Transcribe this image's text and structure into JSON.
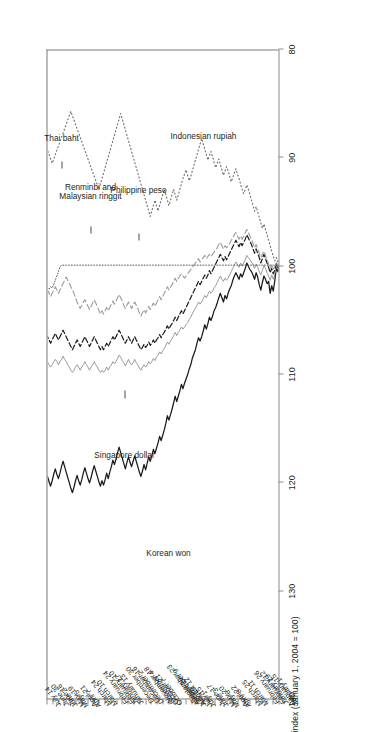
{
  "chart_data": {
    "type": "line",
    "title": "",
    "subtitle": "",
    "ylabel": "index (January 1, 2004 = 100)",
    "xlabel": "",
    "ylim": [
      80,
      140
    ],
    "yticks": [
      140,
      130,
      120,
      110,
      100,
      90,
      80
    ],
    "grid": false,
    "legend_position": "in-plot annotations",
    "orientation": "rotated 90 degrees (page printed sideways)",
    "year_groups": [
      {
        "label": "2004",
        "start_tick": "January 1",
        "end_tick": "December 30"
      },
      {
        "label": "2005",
        "start_tick": "January 13",
        "end_tick": "July 14"
      }
    ],
    "x_tick_labels": [
      "January 1",
      "January 15",
      "January 29",
      "February 12",
      "February 26",
      "March 11",
      "March 25",
      "April 8",
      "April 22",
      "May 6",
      "May 20",
      "June 3",
      "June 17",
      "July 1",
      "July 15",
      "July 29",
      "August 12",
      "August 26",
      "September 9",
      "September 23",
      "October 7",
      "October 21",
      "November 4",
      "November 18",
      "December 2",
      "December 16",
      "December 30",
      "January 13",
      "January 27",
      "February 10",
      "February 24",
      "March 10",
      "March 24",
      "April 7",
      "April 21",
      "May 5",
      "May 19",
      "June 2",
      "June 16",
      "June 30",
      "July 14"
    ],
    "series": [
      {
        "name": "Korean won",
        "style": "solid",
        "color": "#1a1a1a",
        "width": 1.25,
        "values": [
          100.0,
          100.6,
          100.2,
          101.4,
          102.4,
          101.9,
          102.6,
          101.5,
          101.7,
          101.3,
          101.0,
          101.6,
          102.3,
          101.8,
          101.1,
          100.7,
          101.3,
          100.9,
          100.6,
          100.4,
          100.1,
          99.8,
          100.3,
          100.7,
          101.1,
          100.8,
          101.3,
          101.0,
          100.7,
          101.0,
          101.4,
          101.9,
          102.2,
          102.6,
          103.1,
          102.8,
          103.4,
          103.0,
          102.6,
          103.0,
          103.5,
          103.9,
          104.2,
          104.7,
          105.1,
          104.8,
          105.4,
          105.9,
          105.5,
          106.1,
          106.6,
          107.0,
          106.7,
          107.2,
          107.8,
          108.2,
          108.6,
          109.2,
          109.6,
          110.1,
          110.5,
          110.9,
          111.4,
          111.0,
          111.6,
          112.1,
          112.6,
          112.1,
          112.7,
          113.3,
          113.8,
          114.3,
          113.9,
          114.6,
          115.2,
          115.7,
          116.2,
          115.8,
          116.4,
          116.9,
          117.4,
          117.0,
          117.6,
          118.1,
          117.7,
          118.3,
          118.9,
          118.4,
          119.0,
          119.5,
          119.1,
          118.6,
          118.1,
          117.6,
          118.1,
          118.6,
          118.2,
          117.7,
          118.2,
          118.8,
          118.3,
          117.8,
          117.3,
          116.8,
          117.3,
          117.9,
          118.4,
          118.0,
          118.6,
          119.1,
          119.7,
          119.2,
          119.8,
          120.3,
          119.9,
          120.4,
          120.0,
          119.5,
          119.0,
          118.5,
          119.0,
          119.6,
          120.1,
          119.7,
          119.2,
          118.7,
          119.2,
          119.8,
          120.3,
          119.9,
          119.4,
          119.9,
          120.5,
          121.0,
          120.6,
          120.1,
          119.6,
          119.1,
          118.6,
          118.1,
          118.6,
          119.2,
          119.7,
          119.3,
          118.8,
          119.3,
          119.9,
          120.4,
          120.0,
          119.5
        ]
      },
      {
        "name": "Singapore dollar",
        "style": "solid-thin",
        "color": "#8f8f8f",
        "width": 0.9,
        "values": [
          100.0,
          100.4,
          100.1,
          100.8,
          101.3,
          100.9,
          101.4,
          101.0,
          100.7,
          100.3,
          100.0,
          100.5,
          100.9,
          100.6,
          100.2,
          99.9,
          100.3,
          100.0,
          99.7,
          99.5,
          99.3,
          99.1,
          99.5,
          99.8,
          100.1,
          99.8,
          100.2,
          99.9,
          99.7,
          100.0,
          100.3,
          100.6,
          100.9,
          101.2,
          101.4,
          101.2,
          101.5,
          101.3,
          101.0,
          101.3,
          101.6,
          101.9,
          102.1,
          102.4,
          102.6,
          102.4,
          102.7,
          103.0,
          102.8,
          103.1,
          103.4,
          103.6,
          103.4,
          103.7,
          104.0,
          104.2,
          104.5,
          104.8,
          105.0,
          105.3,
          105.5,
          105.7,
          105.9,
          105.7,
          106.0,
          106.2,
          106.5,
          106.2,
          106.5,
          106.8,
          107.0,
          107.3,
          107.1,
          107.4,
          107.7,
          107.9,
          108.2,
          108.0,
          108.3,
          108.5,
          108.8,
          108.6,
          108.9,
          109.1,
          108.9,
          109.2,
          109.4,
          109.2,
          109.4,
          109.7,
          109.5,
          109.2,
          109.0,
          108.7,
          109.0,
          109.2,
          109.0,
          108.7,
          109.0,
          109.3,
          109.0,
          108.8,
          108.5,
          108.3,
          108.6,
          108.9,
          109.1,
          108.9,
          109.2,
          109.4,
          109.7,
          109.4,
          109.7,
          109.9,
          109.7,
          109.9,
          109.7,
          109.4,
          109.2,
          108.9,
          109.2,
          109.4,
          109.7,
          109.4,
          109.2,
          108.9,
          109.2,
          109.4,
          109.7,
          109.4,
          109.2,
          109.4,
          109.7,
          109.9,
          109.7,
          109.4,
          109.2,
          108.9,
          108.7,
          108.4,
          108.7,
          108.9,
          109.2,
          108.9,
          108.7,
          108.9,
          109.2,
          109.4,
          109.2,
          108.9
        ]
      },
      {
        "name": "Renminbi and Malaysian ringgit",
        "style": "dotted-fine",
        "color": "#555555",
        "width": 1.0,
        "values": [
          100.0,
          100.0,
          100.0,
          100.0,
          100.0,
          100.0,
          100.0,
          100.0,
          100.0,
          100.0,
          100.0,
          100.0,
          100.0,
          100.0,
          100.0,
          100.0,
          100.0,
          100.0,
          100.0,
          100.0,
          100.0,
          100.0,
          100.0,
          100.0,
          100.0,
          100.0,
          100.0,
          100.0,
          100.0,
          100.0,
          100.0,
          100.0,
          100.0,
          100.0,
          100.0,
          100.0,
          100.0,
          100.0,
          100.0,
          100.0,
          100.0,
          100.0,
          100.0,
          100.0,
          100.0,
          100.0,
          100.0,
          100.0,
          100.0,
          100.0,
          100.0,
          100.0,
          100.0,
          100.0,
          100.0,
          100.0,
          100.0,
          100.0,
          100.0,
          100.0,
          100.0,
          100.0,
          100.0,
          100.0,
          100.0,
          100.0,
          100.0,
          100.0,
          100.0,
          100.0,
          100.0,
          100.0,
          100.0,
          100.0,
          100.0,
          100.0,
          100.0,
          100.0,
          100.0,
          100.0,
          100.0,
          100.0,
          100.0,
          100.0,
          100.0,
          100.0,
          100.0,
          100.0,
          100.0,
          100.0,
          100.0,
          100.0,
          100.0,
          100.0,
          100.0,
          100.0,
          100.0,
          100.0,
          100.0,
          100.0,
          100.0,
          100.0,
          100.0,
          100.0,
          100.0,
          100.0,
          100.0,
          100.0,
          100.0,
          100.0,
          100.0,
          100.0,
          100.0,
          100.0,
          100.0,
          100.0,
          100.0,
          100.0,
          100.0,
          100.0,
          100.0,
          100.0,
          100.0,
          100.0,
          100.0,
          100.0,
          100.0,
          100.0,
          100.0,
          100.0,
          100.0,
          100.0,
          100.0,
          100.0,
          100.0,
          100.0,
          100.0,
          100.0,
          100.0,
          100.0,
          100.0,
          100.2,
          100.6,
          101.0,
          101.4,
          101.8,
          102.1,
          102.0,
          102.2,
          102.1
        ]
      },
      {
        "name": "Philippine peso",
        "style": "dashed-bold",
        "color": "#1a1a1a",
        "width": 1.2,
        "values": [
          100.0,
          100.2,
          99.8,
          100.4,
          100.8,
          100.3,
          100.7,
          100.2,
          99.8,
          99.4,
          99.0,
          99.4,
          99.8,
          99.3,
          98.9,
          98.5,
          98.9,
          98.5,
          98.1,
          97.8,
          97.5,
          97.2,
          97.6,
          97.9,
          98.2,
          97.9,
          98.3,
          98.0,
          97.7,
          98.0,
          98.3,
          98.6,
          98.9,
          99.2,
          99.5,
          99.2,
          99.6,
          99.3,
          99.0,
          99.3,
          99.6,
          99.9,
          100.2,
          100.5,
          100.8,
          100.5,
          100.9,
          101.2,
          100.9,
          101.2,
          101.5,
          101.8,
          101.5,
          101.8,
          102.1,
          102.4,
          102.7,
          103.0,
          103.3,
          103.6,
          103.9,
          104.2,
          104.5,
          104.2,
          104.5,
          104.8,
          105.1,
          104.8,
          105.1,
          105.4,
          105.6,
          105.9,
          105.6,
          105.9,
          106.2,
          106.4,
          106.7,
          106.4,
          106.7,
          106.9,
          107.2,
          106.9,
          107.2,
          107.4,
          107.1,
          107.4,
          107.6,
          107.3,
          107.6,
          107.8,
          107.5,
          107.2,
          106.9,
          106.6,
          106.9,
          107.2,
          106.9,
          106.6,
          106.9,
          107.2,
          106.9,
          106.6,
          106.3,
          106.0,
          106.3,
          106.6,
          106.9,
          106.6,
          106.9,
          107.2,
          107.5,
          107.2,
          107.5,
          107.8,
          107.5,
          107.8,
          107.5,
          107.2,
          106.9,
          106.6,
          106.9,
          107.2,
          107.5,
          107.2,
          106.9,
          106.6,
          106.9,
          107.2,
          107.5,
          107.2,
          106.9,
          107.2,
          107.5,
          107.8,
          107.5,
          107.2,
          106.9,
          106.6,
          106.3,
          106.0,
          106.3,
          106.6,
          106.9,
          106.6,
          106.3,
          106.6,
          106.9,
          107.2,
          106.9,
          106.6
        ]
      },
      {
        "name": "Thai baht",
        "style": "dashed-light",
        "color": "#9a9a9a",
        "width": 1.1,
        "values": [
          100.0,
          100.1,
          99.7,
          100.1,
          100.4,
          100.0,
          100.3,
          99.9,
          99.5,
          99.1,
          98.7,
          99.0,
          99.3,
          98.9,
          98.5,
          98.1,
          98.4,
          98.0,
          97.6,
          97.3,
          97.0,
          96.7,
          97.0,
          97.3,
          97.6,
          97.3,
          97.6,
          97.3,
          97.0,
          97.2,
          97.5,
          97.7,
          98.0,
          98.2,
          98.4,
          98.2,
          98.5,
          98.2,
          97.9,
          98.1,
          98.4,
          98.6,
          98.8,
          99.0,
          99.2,
          99.0,
          99.2,
          99.4,
          99.1,
          99.3,
          99.5,
          99.7,
          99.4,
          99.6,
          99.8,
          100.0,
          100.2,
          100.4,
          100.6,
          100.8,
          101.0,
          101.2,
          101.0,
          100.8,
          101.0,
          101.2,
          101.5,
          101.2,
          101.5,
          101.8,
          102.0,
          102.3,
          102.0,
          102.3,
          102.6,
          102.9,
          103.2,
          102.9,
          103.2,
          103.5,
          103.8,
          103.5,
          103.8,
          104.1,
          103.8,
          104.1,
          104.4,
          104.1,
          104.4,
          104.7,
          104.4,
          104.0,
          103.7,
          103.4,
          103.7,
          104.0,
          103.7,
          103.4,
          103.7,
          104.0,
          103.7,
          103.3,
          103.0,
          102.7,
          103.0,
          103.3,
          103.6,
          103.3,
          103.6,
          103.9,
          104.2,
          103.9,
          104.2,
          104.5,
          104.2,
          104.5,
          104.2,
          103.8,
          103.5,
          103.2,
          103.5,
          103.8,
          104.1,
          103.8,
          103.5,
          103.2,
          103.4,
          103.7,
          104.0,
          103.7,
          103.4,
          103.0,
          102.6,
          102.3,
          102.0,
          101.7,
          101.4,
          101.1,
          101.4,
          101.7,
          102.0,
          102.3,
          102.6,
          102.3,
          102.0,
          102.3,
          102.6,
          102.9,
          102.6,
          102.3
        ]
      },
      {
        "name": "Indonesian rupiah",
        "style": "dotted",
        "color": "#6b6b6b",
        "width": 1.1,
        "values": [
          100.0,
          99.7,
          99.3,
          99.6,
          99.2,
          98.7,
          98.2,
          97.7,
          97.2,
          96.7,
          96.2,
          96.6,
          96.1,
          95.6,
          95.1,
          94.6,
          95.0,
          94.5,
          94.0,
          93.5,
          93.0,
          92.6,
          93.0,
          93.4,
          93.0,
          92.5,
          92.0,
          91.6,
          91.1,
          91.5,
          91.9,
          92.3,
          91.8,
          91.3,
          90.9,
          91.3,
          91.7,
          91.2,
          90.7,
          90.2,
          90.6,
          91.0,
          90.5,
          90.0,
          89.5,
          89.9,
          90.3,
          89.8,
          89.3,
          88.8,
          88.3,
          88.8,
          89.3,
          89.8,
          90.3,
          90.8,
          91.3,
          91.8,
          92.2,
          91.7,
          91.2,
          91.6,
          92.0,
          92.5,
          93.0,
          93.5,
          94.0,
          93.5,
          93.0,
          93.5,
          94.0,
          94.5,
          94.0,
          93.5,
          93.0,
          93.5,
          94.0,
          94.5,
          95.0,
          94.5,
          94.0,
          94.5,
          95.0,
          95.5,
          95.0,
          94.5,
          94.0,
          93.5,
          93.0,
          92.5,
          92.0,
          91.5,
          91.0,
          90.5,
          90.0,
          89.5,
          89.0,
          88.5,
          88.0,
          87.5,
          87.0,
          86.5,
          86.0,
          86.5,
          87.0,
          87.5,
          88.0,
          88.5,
          89.0,
          89.5,
          90.0,
          90.5,
          91.0,
          91.5,
          92.0,
          92.5,
          93.0,
          92.6,
          92.2,
          91.8,
          91.4,
          91.0,
          90.6,
          90.2,
          89.8,
          89.4,
          89.0,
          88.6,
          88.2,
          87.8,
          87.4,
          87.0,
          86.6,
          86.2,
          85.8,
          86.2,
          86.6,
          87.0,
          87.4,
          87.8,
          88.2,
          88.6,
          89.0,
          89.4,
          89.8,
          90.2,
          90.6,
          90.2,
          89.8,
          89.4
        ]
      }
    ],
    "annotations": [
      {
        "text": "Korean won",
        "series": "Korean won"
      },
      {
        "text": "Singapore dollar",
        "series": "Singapore dollar"
      },
      {
        "text_line1": "Renminbi and",
        "text_line2": "Malaysian ringgit",
        "series": "Renminbi and Malaysian ringgit"
      },
      {
        "text": "Philippine peso",
        "series": "Philippine peso"
      },
      {
        "text": "Thai baht",
        "series": "Thai baht"
      },
      {
        "text": "Indonesian rupiah",
        "series": "Indonesian rupiah"
      }
    ]
  },
  "figure": {
    "axis_title": "index (January 1, 2004 = 100)",
    "year_2004": "2004",
    "year_2005": "2005",
    "ann_korean_won": "Korean won",
    "ann_singapore_dollar": "Singapore dollar",
    "ann_renminbi_1": "Renminbi and",
    "ann_renminbi_2": "Malaysian ringgit",
    "ann_philippine_peso": "Philippine peso",
    "ann_thai_baht": "Thai baht",
    "ann_indonesian_rupiah": "Indonesian rupiah"
  }
}
